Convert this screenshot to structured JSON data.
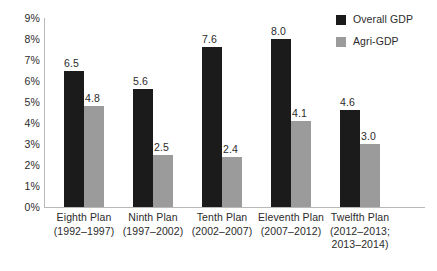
{
  "chart_data": {
    "type": "bar",
    "title": "",
    "xlabel": "",
    "ylabel": "",
    "ylim": [
      0,
      9
    ],
    "grid": false,
    "legend_position": "top-right",
    "categories": [
      "Eighth Plan",
      "Ninth Plan",
      "Tenth Plan",
      "Eleventh Plan",
      "Twelfth Plan"
    ],
    "category_sublabels": [
      "(1992–1997)",
      "(1997–2002)",
      "(2002–2007)",
      "(2007–2012)",
      "(2012–2013;"
    ],
    "category_sublabels2": [
      "",
      "",
      "",
      "",
      "2013–2014)"
    ],
    "series": [
      {
        "name": "Overall GDP",
        "color": "#1b1b1b",
        "values": [
          6.5,
          5.6,
          7.6,
          8.0,
          4.6
        ],
        "value_labels": [
          "6.5",
          "5.6",
          "7.6",
          "8.0",
          "4.6"
        ]
      },
      {
        "name": "Agri-GDP",
        "color": "#9b9b9b",
        "values": [
          4.8,
          2.5,
          2.4,
          4.1,
          3.0
        ],
        "value_labels": [
          "4.8",
          "2.5",
          "2.4",
          "4.1",
          "3.0"
        ]
      }
    ],
    "ytick_labels": [
      "0%",
      "1%",
      "2%",
      "3%",
      "4%",
      "5%",
      "6%",
      "7%",
      "8%",
      "9%"
    ],
    "ytick_values": [
      0,
      1,
      2,
      3,
      4,
      5,
      6,
      7,
      8,
      9
    ]
  },
  "legend": {
    "items": [
      {
        "label": "Overall GDP",
        "color": "#1b1b1b"
      },
      {
        "label": "Agri-GDP",
        "color": "#9b9b9b"
      }
    ]
  },
  "axis": {
    "line_color": "#b8b8b8"
  }
}
